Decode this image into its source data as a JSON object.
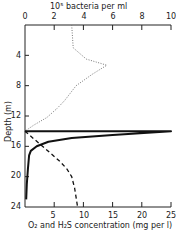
{
  "chart_data": {
    "type": "line",
    "title": "",
    "top_axis": {
      "label": "10⁵ bacteria per ml",
      "ticks": [
        "0",
        "2",
        "4",
        "6",
        "8",
        "10"
      ],
      "range": [
        0,
        10
      ]
    },
    "bottom_axis": {
      "label": "O₂ and H₂S concentration (mg per l)",
      "ticks": [
        "5",
        "10",
        "15",
        "20",
        "25"
      ],
      "range": [
        0,
        25
      ]
    },
    "ylabel": "Depth (m)",
    "yticks": [
      "4",
      "8",
      "12",
      "16",
      "20",
      "24"
    ],
    "ylim": [
      0,
      24
    ],
    "y_inverted": true,
    "series": [
      {
        "name": "Bacteria (10⁵ per ml)",
        "style": "dotted",
        "axis": "top",
        "points": [
          [
            3.2,
            0
          ],
          [
            3.3,
            3
          ],
          [
            4.2,
            4.5
          ],
          [
            5.6,
            5.3
          ],
          [
            4.6,
            6.5
          ],
          [
            3.5,
            8
          ],
          [
            2.7,
            10
          ],
          [
            2.2,
            11
          ],
          [
            1.5,
            12.2
          ],
          [
            0.6,
            13.2
          ],
          [
            0,
            14
          ]
        ]
      },
      {
        "name": "O₂ (mg per l)",
        "style": "solid",
        "axis": "bottom",
        "points": [
          [
            0,
            14
          ],
          [
            25,
            14
          ],
          [
            15,
            14.5
          ],
          [
            8,
            14.9
          ],
          [
            4,
            15.4
          ],
          [
            2,
            16
          ],
          [
            1,
            16.6
          ],
          [
            0.7,
            17.2
          ],
          [
            0.5,
            19
          ],
          [
            0.3,
            21
          ],
          [
            0.2,
            23
          ]
        ]
      },
      {
        "name": "H₂S (mg per l)",
        "style": "dashed",
        "axis": "bottom",
        "points": [
          [
            0,
            14
          ],
          [
            1.5,
            15
          ],
          [
            3,
            16
          ],
          [
            4.5,
            17
          ],
          [
            6,
            18
          ],
          [
            7.2,
            19
          ],
          [
            8,
            20
          ],
          [
            8.5,
            21.5
          ],
          [
            8.8,
            23
          ],
          [
            9,
            24
          ]
        ]
      }
    ],
    "grid": false,
    "legend": "none"
  }
}
